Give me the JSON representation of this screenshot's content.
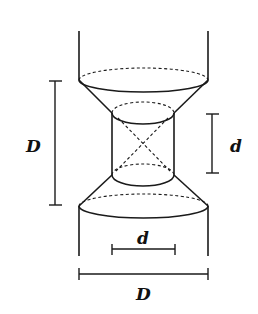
{
  "diagram": {
    "type": "geometric-figure",
    "stroke_color": "#1a1a1a",
    "background": "#ffffff",
    "labels": {
      "left_height": "D",
      "right_height": "d",
      "bottom_inner_width": "d",
      "bottom_outer_width": "D"
    }
  }
}
